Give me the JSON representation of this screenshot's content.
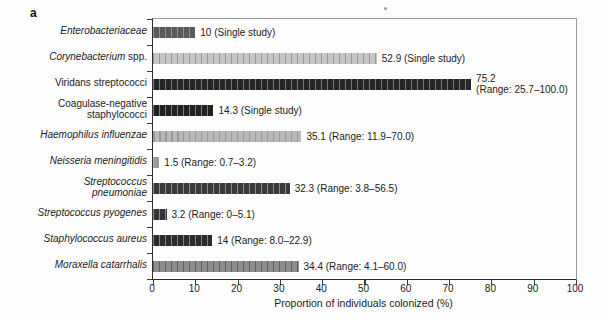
{
  "panel_label": "a",
  "chart_data": {
    "type": "bar",
    "orientation": "horizontal",
    "title": "",
    "xlabel": "Proportion of individuals colonized (%)",
    "ylabel": "",
    "xlim": [
      0,
      100
    ],
    "x_ticks": [
      "0",
      "10",
      "20",
      "30",
      "40",
      "50",
      "60",
      "70",
      "80",
      "90",
      "100"
    ],
    "grid": false,
    "legend": "none",
    "rows": [
      {
        "label": "Enterobacteriaceae",
        "name_parts": [
          {
            "text": "Enterobacteriaceae",
            "italic": true
          }
        ],
        "value": 10,
        "range": null,
        "annotation": "10 (Single study)",
        "bar_base_color": "#5a5a5a",
        "bar_stripe_color": "#909090"
      },
      {
        "label": "Corynebacterium spp.",
        "name_parts": [
          {
            "text": "Corynebacterium",
            "italic": true
          },
          {
            "text": " spp.",
            "italic": false
          }
        ],
        "value": 52.9,
        "range": null,
        "annotation": "52.9 (Single study)",
        "bar_base_color": "#c6c6c6",
        "bar_stripe_color": "#9a9a9a"
      },
      {
        "label": "Viridans streptococci",
        "name_parts": [
          {
            "text": "Viridans streptococci",
            "italic": false
          }
        ],
        "value": 75.2,
        "range": [
          25.7,
          100.0
        ],
        "annotation": "75.2\n(Range: 25.7–100.0)",
        "bar_base_color": "#262626",
        "bar_stripe_color": "#787878"
      },
      {
        "label": "Coagulase-negative staphylococci",
        "name_parts": [
          {
            "text": "Coagulase-negative\nstaphylococci",
            "italic": false
          }
        ],
        "value": 14.3,
        "range": null,
        "annotation": "14.3 (Single study)",
        "bar_base_color": "#212121",
        "bar_stripe_color": "#7d7d7d"
      },
      {
        "label": "Haemophilus influenzae",
        "name_parts": [
          {
            "text": "Haemophilus influenzae",
            "italic": true
          }
        ],
        "value": 35.1,
        "range": [
          11.9,
          70.0
        ],
        "annotation": "35.1 (Range: 11.9–70.0)",
        "bar_base_color": "#b9b9b9",
        "bar_stripe_color": "#999999"
      },
      {
        "label": "Neisseria meningitidis",
        "name_parts": [
          {
            "text": "Neisseria meningitidis",
            "italic": true
          }
        ],
        "value": 1.5,
        "range": [
          0.7,
          3.2
        ],
        "annotation": "1.5 (Range: 0.7–3.2)",
        "bar_base_color": "#9a9a9a",
        "bar_stripe_color": "#b5b5b5"
      },
      {
        "label": "Streptococcus pneumoniae",
        "name_parts": [
          {
            "text": "Streptococcus\npneumoniae",
            "italic": true
          }
        ],
        "value": 32.3,
        "range": [
          3.8,
          56.5
        ],
        "annotation": "32.3 (Range: 3.8–56.5)",
        "bar_base_color": "#3a3a3a",
        "bar_stripe_color": "#8d8d8d"
      },
      {
        "label": "Streptococcus pyogenes",
        "name_parts": [
          {
            "text": "Streptococcus pyogenes",
            "italic": true
          }
        ],
        "value": 3.2,
        "range": [
          0,
          5.1
        ],
        "annotation": "3.2 (Range: 0–5.1)",
        "bar_base_color": "#343434",
        "bar_stripe_color": "#888888"
      },
      {
        "label": "Staphylococcus aureus",
        "name_parts": [
          {
            "text": "Staphylococcus aureus",
            "italic": true
          }
        ],
        "value": 14,
        "range": [
          8.0,
          22.9
        ],
        "annotation": "14 (Range: 8.0–22.9)",
        "bar_base_color": "#2b2b2b",
        "bar_stripe_color": "#828282"
      },
      {
        "label": "Moraxella catarrhalis",
        "name_parts": [
          {
            "text": "Moraxella catarrhalis",
            "italic": true
          }
        ],
        "value": 34.4,
        "range": [
          4.1,
          60.0
        ],
        "annotation": "34.4 (Range: 4.1–60.0)",
        "bar_base_color": "#8e8e8e",
        "bar_stripe_color": "#616161"
      }
    ]
  }
}
